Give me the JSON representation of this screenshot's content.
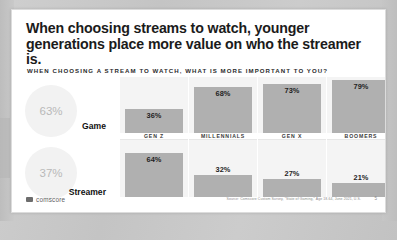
{
  "slide": {
    "headline": "When choosing streams to watch, younger generations place more value on who the streamer is.",
    "subtitle": "WHEN CHOOSING A STREAM TO WATCH, WHAT IS MORE IMPORTANT TO YOU?"
  },
  "summary": {
    "game": {
      "label": "Game",
      "value": "63%"
    },
    "streamer": {
      "label": "Streamer",
      "value": "37%"
    }
  },
  "footer": {
    "logo_text": "comscore",
    "logo_icon": "comscore-mark-icon",
    "source": "Source: Comscore Custom Survey, \"State of Gaming,\" Age 18-64, June 2021, U.S.",
    "page_number": "5"
  },
  "colors": {
    "bar": "#b0b0b0",
    "column_background": "#f4f4f4",
    "circle_background": "#f2f2f2",
    "circle_text": "#b9b9b9",
    "slide_background": "#ffffff",
    "backdrop": "#c9c9c9",
    "headline_text": "#1b1b1b"
  },
  "chart_data": {
    "type": "bar",
    "title": "When choosing streams to watch, younger generations place more value on who the streamer is.",
    "subtitle": "WHEN CHOOSING A STREAM TO WATCH, WHAT IS MORE IMPORTANT TO YOU?",
    "xlabel": "",
    "ylabel": "",
    "ylim": [
      0,
      100
    ],
    "grid": false,
    "legend_position": "left",
    "categories": [
      "GEN Z",
      "MILLENNIALS",
      "GEN X",
      "BOOMERS"
    ],
    "series": [
      {
        "name": "Game",
        "values": [
          36,
          68,
          73,
          79
        ],
        "labels": [
          "36%",
          "68%",
          "73%",
          "79%"
        ],
        "overall": 63,
        "overall_label": "63%"
      },
      {
        "name": "Streamer",
        "values": [
          64,
          32,
          27,
          21
        ],
        "labels": [
          "64%",
          "32%",
          "27%",
          "21%"
        ],
        "overall": 37,
        "overall_label": "37%"
      }
    ],
    "annotations": [
      "Source: Comscore Custom Survey, \"State of Gaming,\" Age 18-64, June 2021, U.S."
    ]
  },
  "columns": [
    {
      "label": "GEN Z",
      "game": "36%",
      "streamer": "64%",
      "game_h": 24,
      "streamer_h": 44,
      "game_outside": false,
      "streamer_outside": false
    },
    {
      "label": "MILLENNIALS",
      "game": "68%",
      "streamer": "32%",
      "game_h": 46,
      "streamer_h": 22,
      "game_outside": false,
      "streamer_outside": true
    },
    {
      "label": "GEN X",
      "game": "73%",
      "streamer": "27%",
      "game_h": 49,
      "streamer_h": 18,
      "game_outside": false,
      "streamer_outside": true
    },
    {
      "label": "BOOMERS",
      "game": "79%",
      "streamer": "21%",
      "game_h": 53,
      "streamer_h": 14,
      "game_outside": false,
      "streamer_outside": true
    }
  ]
}
